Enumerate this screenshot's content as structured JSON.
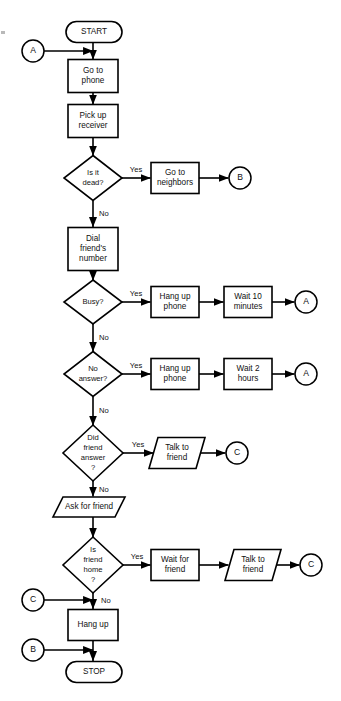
{
  "diagram": {
    "type": "flowchart",
    "canvas": {
      "width": 341,
      "height": 701
    },
    "colors": {
      "stroke": "#000000",
      "fill": "#ffffff",
      "text": "#111111"
    }
  },
  "nodes": [
    {
      "id": "start",
      "shape": "terminator",
      "lines": [
        "START"
      ],
      "cx": 94,
      "cy": 32,
      "w": 56,
      "h": 21
    },
    {
      "id": "go-to-phone",
      "shape": "process",
      "lines": [
        "Go to",
        "phone"
      ],
      "cx": 93,
      "cy": 76,
      "w": 50,
      "h": 33
    },
    {
      "id": "pick-up-receiver",
      "shape": "process",
      "lines": [
        "Pick up",
        "receiver"
      ],
      "cx": 93,
      "cy": 121,
      "w": 50,
      "h": 33
    },
    {
      "id": "is-it-dead",
      "shape": "decision",
      "lines": [
        "Is it",
        "dead?"
      ],
      "cx": 93,
      "cy": 178,
      "w": 58,
      "h": 45
    },
    {
      "id": "go-to-neighbors",
      "shape": "process",
      "lines": [
        "Go to",
        "neighbors"
      ],
      "cx": 175,
      "cy": 178,
      "w": 48,
      "h": 31
    },
    {
      "id": "dial-number",
      "shape": "process",
      "lines": [
        "Dial",
        "friend's",
        "number"
      ],
      "cx": 93,
      "cy": 249,
      "w": 50,
      "h": 43
    },
    {
      "id": "busy",
      "shape": "decision",
      "lines": [
        "Busy?"
      ],
      "cx": 93,
      "cy": 302,
      "w": 58,
      "h": 44
    },
    {
      "id": "hang-up-phone-1",
      "shape": "process",
      "lines": [
        "Hang up",
        "phone"
      ],
      "cx": 175,
      "cy": 302,
      "w": 48,
      "h": 31
    },
    {
      "id": "wait-10-minutes",
      "shape": "process",
      "lines": [
        "Wait 10",
        "minutes"
      ],
      "cx": 248,
      "cy": 302,
      "w": 48,
      "h": 31
    },
    {
      "id": "no-answer",
      "shape": "decision",
      "lines": [
        "No",
        "answer?"
      ],
      "cx": 93,
      "cy": 374,
      "w": 58,
      "h": 45
    },
    {
      "id": "hang-up-phone-2",
      "shape": "process",
      "lines": [
        "Hang up",
        "phone"
      ],
      "cx": 175,
      "cy": 374,
      "w": 48,
      "h": 31
    },
    {
      "id": "wait-2-hours",
      "shape": "process",
      "lines": [
        "Wait 2",
        "hours"
      ],
      "cx": 248,
      "cy": 374,
      "w": 48,
      "h": 31
    },
    {
      "id": "did-friend-answer",
      "shape": "decision",
      "lines": [
        "Did",
        "friend",
        "answer",
        "?"
      ],
      "cx": 93,
      "cy": 453,
      "w": 60,
      "h": 56
    },
    {
      "id": "talk-to-friend-1",
      "shape": "input-output",
      "lines": [
        "Talk to",
        "friend"
      ],
      "cx": 177,
      "cy": 453,
      "w": 56,
      "h": 31
    },
    {
      "id": "ask-for-friend",
      "shape": "input-output",
      "lines": [
        "Ask for friend"
      ],
      "cx": 89,
      "cy": 507,
      "w": 72,
      "h": 20
    },
    {
      "id": "is-friend-home",
      "shape": "decision",
      "lines": [
        "Is",
        "friend",
        "home",
        "?"
      ],
      "cx": 93,
      "cy": 565,
      "w": 60,
      "h": 56
    },
    {
      "id": "wait-for-friend",
      "shape": "process",
      "lines": [
        "Wait for",
        "friend"
      ],
      "cx": 175,
      "cy": 565,
      "w": 48,
      "h": 31
    },
    {
      "id": "talk-to-friend-2",
      "shape": "input-output",
      "lines": [
        "Talk to",
        "friend"
      ],
      "cx": 253,
      "cy": 565,
      "w": 56,
      "h": 31
    },
    {
      "id": "hang-up",
      "shape": "process",
      "lines": [
        "Hang up"
      ],
      "cx": 93,
      "cy": 625,
      "w": 50,
      "h": 31
    },
    {
      "id": "stop",
      "shape": "terminator",
      "lines": [
        "STOP"
      ],
      "cx": 94,
      "cy": 672,
      "w": 56,
      "h": 21
    }
  ],
  "connectors": [
    {
      "id": "connector-a-top",
      "label": "A",
      "cx": 33,
      "cy": 51,
      "r": 11
    },
    {
      "id": "connector-b-right",
      "label": "B",
      "cx": 240,
      "cy": 178,
      "r": 11
    },
    {
      "id": "connector-a-busy",
      "label": "A",
      "cx": 306,
      "cy": 302,
      "r": 11
    },
    {
      "id": "connector-a-answer",
      "label": "A",
      "cx": 306,
      "cy": 374,
      "r": 11
    },
    {
      "id": "connector-c-talk1",
      "label": "C",
      "cx": 237,
      "cy": 453,
      "r": 11
    },
    {
      "id": "connector-c-talk2",
      "label": "C",
      "cx": 311,
      "cy": 565,
      "r": 11
    },
    {
      "id": "connector-c-left",
      "label": "C",
      "cx": 33,
      "cy": 600,
      "r": 11
    },
    {
      "id": "connector-b-left",
      "label": "B",
      "cx": 33,
      "cy": 650,
      "r": 11
    }
  ],
  "edges": [
    {
      "id": "edge-start-to-go-to-phone",
      "from": "start",
      "to": "go-to-phone",
      "label": "",
      "path": "M 93 42.5 L 93 59.5",
      "arrow": true
    },
    {
      "id": "edge-a-to-start-line",
      "from": "connector-a-top",
      "to": "go-to-phone",
      "label": "",
      "path": "M 44 51 L 93 51",
      "arrow": true
    },
    {
      "id": "edge-phone-to-receiver",
      "from": "go-to-phone",
      "to": "pick-up-receiver",
      "label": "",
      "path": "M 93 92.5 L 93 104.5",
      "arrow": true
    },
    {
      "id": "edge-receiver-to-dead",
      "from": "pick-up-receiver",
      "to": "is-it-dead",
      "label": "",
      "path": "M 93 137.5 L 93 155.5",
      "arrow": true
    },
    {
      "id": "edge-dead-yes",
      "from": "is-it-dead",
      "to": "go-to-neighbors",
      "label": "Yes",
      "path": "M 122 178 L 150.5 178",
      "arrow": true
    },
    {
      "id": "edge-neighbors-to-b",
      "from": "go-to-neighbors",
      "to": "connector-b-right",
      "label": "",
      "path": "M 199 178 L 228.5 178",
      "arrow": true
    },
    {
      "id": "edge-dead-no",
      "from": "is-it-dead",
      "to": "dial-number",
      "label": "No",
      "path": "M 93 200.5 L 93 227",
      "arrow": true
    },
    {
      "id": "edge-dial-to-busy",
      "from": "dial-number",
      "to": "busy",
      "label": "",
      "path": "M 93 270.5 L 93 280.5",
      "arrow": true
    },
    {
      "id": "edge-busy-yes",
      "from": "busy",
      "to": "hang-up-phone-1",
      "label": "Yes",
      "path": "M 122 302 L 150.5 302",
      "arrow": true
    },
    {
      "id": "edge-hangup1-to-wait10",
      "from": "hang-up-phone-1",
      "to": "wait-10-minutes",
      "label": "",
      "path": "M 199 302 L 223.5 302",
      "arrow": true
    },
    {
      "id": "edge-wait10-to-a",
      "from": "wait-10-minutes",
      "to": "connector-a-busy",
      "label": "",
      "path": "M 272 302 L 294.5 302",
      "arrow": true
    },
    {
      "id": "edge-busy-no",
      "from": "busy",
      "to": "no-answer",
      "label": "No",
      "path": "M 93 324 L 93 351.5",
      "arrow": true
    },
    {
      "id": "edge-noanswer-yes",
      "from": "no-answer",
      "to": "hang-up-phone-2",
      "label": "Yes",
      "path": "M 122 374 L 150.5 374",
      "arrow": true
    },
    {
      "id": "edge-hangup2-to-wait2",
      "from": "hang-up-phone-2",
      "to": "wait-2-hours",
      "label": "",
      "path": "M 199 374 L 223.5 374",
      "arrow": true
    },
    {
      "id": "edge-wait2-to-a",
      "from": "wait-2-hours",
      "to": "connector-a-answer",
      "label": "",
      "path": "M 272 374 L 294.5 374",
      "arrow": true
    },
    {
      "id": "edge-noanswer-no",
      "from": "no-answer",
      "to": "did-friend-answer",
      "label": "No",
      "path": "M 93 396.5 L 93 425.5",
      "arrow": true
    },
    {
      "id": "edge-didanswer-yes",
      "from": "did-friend-answer",
      "to": "talk-to-friend-1",
      "label": "Yes",
      "path": "M 123 453 L 153.5 453",
      "arrow": true
    },
    {
      "id": "edge-talk1-to-c",
      "from": "talk-to-friend-1",
      "to": "connector-c-talk1",
      "label": "",
      "path": "M 198 453 L 225.5 453",
      "arrow": true
    },
    {
      "id": "edge-didanswer-no",
      "from": "did-friend-answer",
      "to": "ask-for-friend",
      "label": "No",
      "path": "M 93 481 L 93 496.5",
      "arrow": true
    },
    {
      "id": "edge-ask-to-home",
      "from": "ask-for-friend",
      "to": "is-friend-home",
      "label": "",
      "path": "M 93 517 L 93 537.5",
      "arrow": true
    },
    {
      "id": "edge-home-yes",
      "from": "is-friend-home",
      "to": "wait-for-friend",
      "label": "Yes",
      "path": "M 123 565 L 150.5 565",
      "arrow": true
    },
    {
      "id": "edge-waitfriend-to-talk2",
      "from": "wait-for-friend",
      "to": "talk-to-friend-2",
      "label": "",
      "path": "M 199 565 L 228.5 565",
      "arrow": true
    },
    {
      "id": "edge-talk2-to-c",
      "from": "talk-to-friend-2",
      "to": "connector-c-talk2",
      "label": "",
      "path": "M 275 565 L 299.5 565",
      "arrow": true
    },
    {
      "id": "edge-home-no",
      "from": "is-friend-home",
      "to": "hang-up",
      "label": "No",
      "path": "M 93 593 L 93 609",
      "arrow": true
    },
    {
      "id": "edge-c-left-to-main",
      "from": "connector-c-left",
      "to": "hang-up",
      "label": "",
      "path": "M 44 600 L 93 600",
      "arrow": true
    },
    {
      "id": "edge-hangup-to-stop",
      "from": "hang-up",
      "to": "stop",
      "label": "",
      "path": "M 93 640.5 L 93 661",
      "arrow": true
    },
    {
      "id": "edge-b-left-to-main",
      "from": "connector-b-left",
      "to": "stop",
      "label": "",
      "path": "M 44 650 L 93 650",
      "arrow": true
    }
  ],
  "edge_labels": [
    {
      "id": "label-dead-yes",
      "text": "Yes",
      "x": 136,
      "y": 170,
      "anchor": "middle"
    },
    {
      "id": "label-dead-no",
      "text": "No",
      "x": 99,
      "y": 214,
      "anchor": "start"
    },
    {
      "id": "label-busy-yes",
      "text": "Yes",
      "x": 136,
      "y": 294,
      "anchor": "middle"
    },
    {
      "id": "label-busy-no",
      "text": "No",
      "x": 99,
      "y": 338,
      "anchor": "start"
    },
    {
      "id": "label-noanswer-yes",
      "text": "Yes",
      "x": 136,
      "y": 366,
      "anchor": "middle"
    },
    {
      "id": "label-noanswer-no",
      "text": "No",
      "x": 99,
      "y": 411,
      "anchor": "start"
    },
    {
      "id": "label-didanswer-yes",
      "text": "Yes",
      "x": 138,
      "y": 445,
      "anchor": "middle"
    },
    {
      "id": "label-didanswer-no",
      "text": "No",
      "x": 99,
      "y": 490,
      "anchor": "start"
    },
    {
      "id": "label-home-yes",
      "text": "Yes",
      "x": 137,
      "y": 557,
      "anchor": "middle"
    },
    {
      "id": "label-home-no",
      "text": "No",
      "x": 101,
      "y": 601,
      "anchor": "start"
    }
  ]
}
